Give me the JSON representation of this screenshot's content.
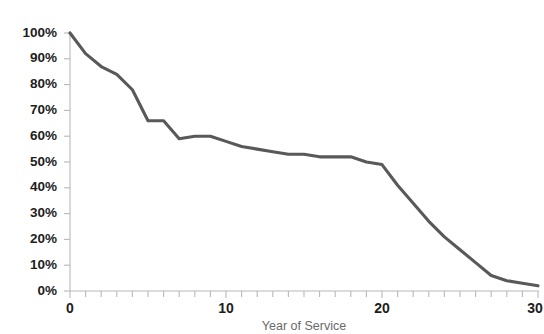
{
  "chart_data": {
    "type": "line",
    "title": "",
    "xlabel": "Year of Service",
    "ylabel": "",
    "xlim": [
      0,
      30
    ],
    "ylim": [
      0,
      100
    ],
    "grid": false,
    "legend": false,
    "x_tick_labels": [
      "0",
      "10",
      "20",
      "30"
    ],
    "x_tick_values": [
      0,
      10,
      20,
      30
    ],
    "x_minor_tick_step": 1,
    "y_tick_labels": [
      "0%",
      "10%",
      "20%",
      "30%",
      "40%",
      "50%",
      "60%",
      "70%",
      "80%",
      "90%",
      "100%"
    ],
    "y_tick_values": [
      0,
      10,
      20,
      30,
      40,
      50,
      60,
      70,
      80,
      90,
      100
    ],
    "series": [
      {
        "name": "Retention",
        "color": "#595959",
        "x": [
          0,
          1,
          2,
          3,
          4,
          5,
          6,
          7,
          8,
          9,
          10,
          11,
          12,
          13,
          14,
          15,
          16,
          17,
          18,
          19,
          20,
          21,
          22,
          23,
          24,
          25,
          26,
          27,
          28,
          29,
          30
        ],
        "values": [
          100,
          92,
          87,
          84,
          78,
          66,
          66,
          59,
          60,
          60,
          58,
          56,
          55,
          54,
          53,
          53,
          52,
          52,
          52,
          50,
          49,
          41,
          34,
          27,
          21,
          16,
          11,
          6,
          4,
          3,
          2
        ]
      }
    ]
  },
  "axes": {
    "x_axis_title": "Year of Service"
  },
  "colors": {
    "series_line": "#595959",
    "axis": "#b9b9b9",
    "tick_text": "#1d1d1d",
    "axis_title_text": "#6a6a6a"
  }
}
